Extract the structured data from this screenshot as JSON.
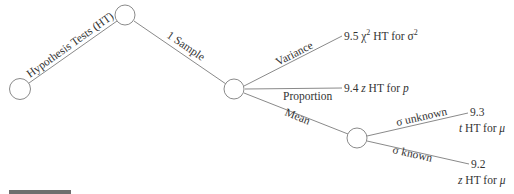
{
  "diagram": {
    "type": "tree",
    "edges": {
      "root": "Hypothesis Tests (HT)",
      "one_sample": "1 Sample",
      "variance": "Variance",
      "proportion": "Proportion",
      "mean": "Mean",
      "sigma_unknown": "σ unknown",
      "sigma_known": "σ known"
    },
    "leaves": {
      "variance": {
        "section": "9.5",
        "sym": "χ",
        "sup": "2",
        "text": " HT for ",
        "param": "σ",
        "param_sup": "2"
      },
      "proportion": {
        "section": "9.4",
        "sym": "z",
        "text": " HT for ",
        "param": "p"
      },
      "sigma_unknown": {
        "section": "9.3",
        "sym": "t",
        "text": " HT for ",
        "param": "μ"
      },
      "sigma_known": {
        "section": "9.2",
        "sym": "z",
        "text": " HT for ",
        "param": "μ"
      }
    },
    "colors": {
      "line": "#8a8a8a",
      "text": "#333333"
    }
  }
}
